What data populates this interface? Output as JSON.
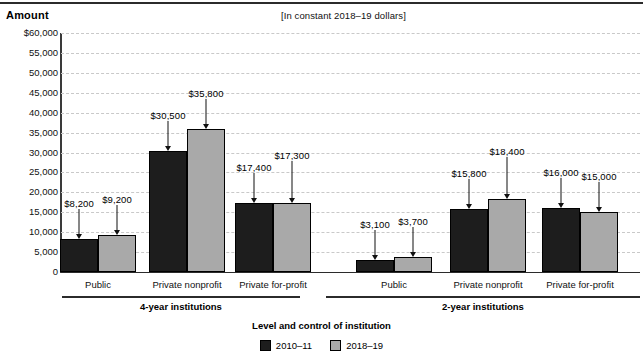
{
  "header": {
    "amount_label": "Amount",
    "subtitle": "[In constant 2018–19 dollars]"
  },
  "axis_title": "Level and control of institution",
  "groups": [
    {
      "name": "4-year institutions"
    },
    {
      "name": "2-year institutions"
    }
  ],
  "legend": [
    {
      "label": "2010–11",
      "color": "#1d1d1d"
    },
    {
      "label": "2018–19",
      "color": "#a9a9a9"
    }
  ],
  "chart_data": {
    "type": "bar",
    "title": "Amount",
    "subtitle": "[In constant 2018–19 dollars]",
    "xlabel": "Level and control of institution",
    "ylabel": "Amount",
    "ylim": [
      0,
      60000
    ],
    "ytick_labels": [
      "$60,000",
      "55,000",
      "50,000",
      "45,000",
      "40,000",
      "35,000",
      "30,000",
      "25,000",
      "20,000",
      "15,000",
      "10,000",
      "5,000",
      "0"
    ],
    "ytick_values": [
      60000,
      55000,
      50000,
      45000,
      40000,
      35000,
      30000,
      25000,
      20000,
      15000,
      10000,
      5000,
      0
    ],
    "grid": true,
    "legend_position": "bottom",
    "group_labels": [
      "4-year institutions",
      "2-year institutions"
    ],
    "categories": [
      "Public",
      "Private nonprofit",
      "Private for-profit",
      "Public",
      "Private nonprofit",
      "Private for-profit"
    ],
    "category_groups": [
      0,
      0,
      0,
      1,
      1,
      1
    ],
    "series": [
      {
        "name": "2010–11",
        "color": "#1d1d1d",
        "values": [
          8200,
          30500,
          17400,
          3100,
          15800,
          16000
        ],
        "labels": [
          "$8,200",
          "$30,500",
          "$17,400",
          "$3,100",
          "$15,800",
          "$16,000"
        ]
      },
      {
        "name": "2018–19",
        "color": "#a9a9a9",
        "values": [
          9200,
          35800,
          17300,
          3700,
          18400,
          15000
        ],
        "labels": [
          "$9,200",
          "$35,800",
          "$17,300",
          "$3,700",
          "$18,400",
          "$15,000"
        ]
      }
    ]
  }
}
